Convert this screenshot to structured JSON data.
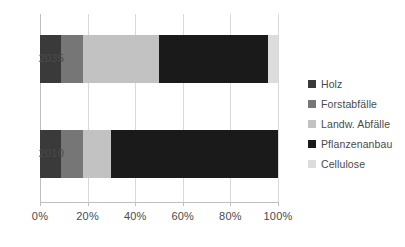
{
  "chart_data": {
    "type": "bar",
    "orientation": "horizontal",
    "stacked": true,
    "stack_mode": "percent",
    "title": "",
    "subtitle": "",
    "xlabel": "",
    "ylabel": "",
    "categories": [
      "2010",
      "2035"
    ],
    "category_order_top_to_bottom": [
      "2035",
      "2010"
    ],
    "xlim": [
      0,
      100
    ],
    "xticks": [
      0,
      20,
      40,
      60,
      80,
      100
    ],
    "xticklabels": [
      "0%",
      "20%",
      "40%",
      "60%",
      "80%",
      "100%"
    ],
    "grid": true,
    "grid_axis": "x",
    "legend_position": "right",
    "series": [
      {
        "name": "Holz",
        "color": "#3a3a3a",
        "values": [
          9,
          9
        ]
      },
      {
        "name": "Forstabfälle",
        "color": "#767676",
        "values": [
          9,
          9
        ]
      },
      {
        "name": "Landw. Abfälle",
        "color": "#c2c2c2",
        "values": [
          12,
          32
        ]
      },
      {
        "name": "Pflanzenanbau",
        "color": "#1a1a1a",
        "values": [
          70,
          46
        ]
      },
      {
        "name": "Cellulose",
        "color": "#dcdcdc",
        "values": [
          0,
          4
        ]
      }
    ],
    "colors": {
      "gridline": "#d9d9d9",
      "axis": "#bfbfbf",
      "text": "#4a4a4a",
      "background": "#ffffff"
    }
  }
}
